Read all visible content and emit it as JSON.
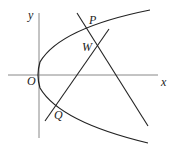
{
  "diagram": {
    "labels": {
      "y_axis": "y",
      "x_axis": "x",
      "origin": "O",
      "point_p": "P",
      "point_w": "W",
      "point_q": "Q"
    }
  }
}
